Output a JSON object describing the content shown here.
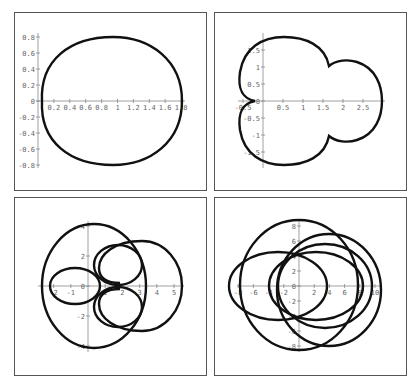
{
  "chart_data": [
    {
      "type": "line",
      "title": "",
      "panel": "top-left",
      "description": "Closed egg-shaped polar curve",
      "xlabel": "",
      "ylabel": "",
      "xlim": [
        0,
        1.85
      ],
      "ylim": [
        -0.85,
        0.85
      ],
      "x_ticks": [
        "0.2",
        "0.4",
        "0.6",
        "0.8",
        "1",
        "1.2",
        "1.4",
        "1.6",
        "1.8"
      ],
      "y_ticks": [
        "0.8",
        "0.6",
        "0.4",
        "0.2",
        "0",
        "-0.2",
        "-0.4",
        "-0.6",
        "-0.8"
      ],
      "extent": {
        "x_min": 0.05,
        "x_max": 1.8,
        "y_min": -0.8,
        "y_max": 0.8
      }
    },
    {
      "type": "line",
      "title": "",
      "panel": "top-right",
      "description": "Three-lobed closed curve with cusp near (-0.2, 0)",
      "xlabel": "",
      "ylabel": "",
      "xlim": [
        -0.25,
        3.1
      ],
      "ylim": [
        -1.85,
        1.85
      ],
      "x_ticks": [
        "-0.5",
        "0",
        "0.5",
        "1",
        "1.5",
        "2",
        "2.5"
      ],
      "y_ticks": [
        "1.5",
        "1",
        "0.5",
        "0",
        "-0.5",
        "-1",
        "-1.5"
      ],
      "extent": {
        "x_min": -0.2,
        "x_max": 3.0,
        "y_min": -1.85,
        "y_max": 1.85
      }
    },
    {
      "type": "line",
      "title": "",
      "panel": "bottom-left",
      "description": "Closed curve with overlapping loops",
      "xlabel": "",
      "ylabel": "",
      "xlim": [
        -3,
        5.5
      ],
      "ylim": [
        -4.3,
        4.3
      ],
      "x_ticks": [
        "-2",
        "-1",
        "0",
        "1",
        "2",
        "3",
        "4",
        "5"
      ],
      "y_ticks": [
        "4",
        "2",
        "0",
        "-2",
        "-4"
      ],
      "extent": {
        "x_min": -2.8,
        "x_max": 5.5,
        "y_min": -4.2,
        "y_max": 4.2
      }
    },
    {
      "type": "line",
      "title": "",
      "panel": "bottom-right",
      "description": "Closed curve with four overlapping loops",
      "xlabel": "",
      "ylabel": "",
      "xlim": [
        -8,
        10.5
      ],
      "ylim": [
        -9,
        9.5
      ],
      "x_ticks": [
        "-8",
        "-6",
        "-4",
        "-2",
        "0",
        "2",
        "4",
        "6",
        "8",
        "10"
      ],
      "y_ticks": [
        "8",
        "6",
        "4",
        "2",
        "0",
        "-2",
        "-4",
        "-6",
        "-8"
      ],
      "extent": {
        "x_min": -8,
        "x_max": 10.5,
        "y_min": -8.5,
        "y_max": 9
      }
    }
  ]
}
